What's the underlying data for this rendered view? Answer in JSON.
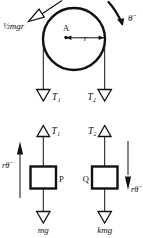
{
  "figure": {
    "title_visible": false,
    "background_color": "#ffffff",
    "ink_color": "#111111",
    "panels": [
      {
        "name": "pulley-free-body-diagram",
        "description": "Pulley disc of radius r centred at A with torque arrow and two vertical cords carrying tensions",
        "labels": {
          "torque": "½mgr",
          "centre": "A",
          "radius": "r",
          "angular_accel": "θ̈",
          "tension_left": "T₁",
          "tension_right": "T₂"
        }
      },
      {
        "name": "blocks-free-body-diagram",
        "description": "Blocks P and Q hanging on the cords with tensions up, weights down and tangential accelerations",
        "labels": {
          "tension_left": "T₁",
          "tension_right": "T₂",
          "block_left": "P",
          "block_right": "Q",
          "weight_left": "mg",
          "weight_right": "kmg",
          "accel_left": "rθ̈",
          "accel_right": "rθ̈"
        }
      }
    ]
  }
}
